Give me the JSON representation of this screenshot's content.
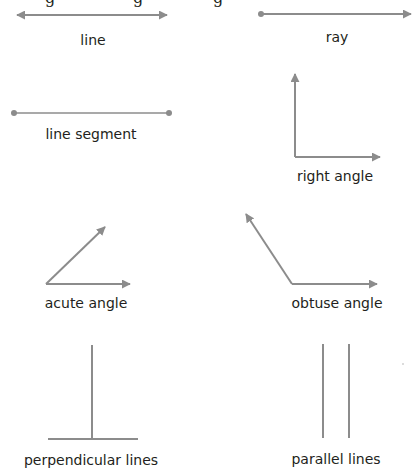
{
  "colors": {
    "stroke": "#8c8c8c",
    "text": "#231f20",
    "background": "#ffffff"
  },
  "header_cutoff": "g          g          g",
  "figures": [
    {
      "id": "line",
      "label": "line"
    },
    {
      "id": "ray",
      "label": "ray"
    },
    {
      "id": "line-segment",
      "label": "line segment"
    },
    {
      "id": "right-angle",
      "label": "right angle"
    },
    {
      "id": "acute-angle",
      "label": "acute angle"
    },
    {
      "id": "obtuse-angle",
      "label": "obtuse angle"
    },
    {
      "id": "perpendicular-lines",
      "label": "perpendicular lines"
    },
    {
      "id": "parallel-lines",
      "label": "parallel lines"
    }
  ]
}
